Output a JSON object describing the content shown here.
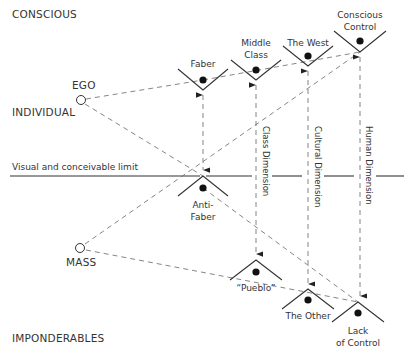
{
  "zones": {
    "top": "CONSCIOUS",
    "bottom": "IMPONDERABLES",
    "individual": "INDIVIDUAL"
  },
  "sources": {
    "ego": "EGO",
    "mass": "MASS"
  },
  "limit_label": "Visual and conceivable limit",
  "upper_nodes": [
    {
      "id": "faber",
      "lines": [
        "Faber"
      ]
    },
    {
      "id": "middle-class",
      "lines": [
        "Middle",
        "Class"
      ]
    },
    {
      "id": "the-west",
      "lines": [
        "The West"
      ]
    },
    {
      "id": "conscious-control",
      "lines": [
        "Conscious",
        "Control"
      ]
    }
  ],
  "lower_nodes": [
    {
      "id": "anti-faber",
      "lines": [
        "Anti-",
        "Faber"
      ]
    },
    {
      "id": "pueblo",
      "lines": [
        "“Pueblo”"
      ]
    },
    {
      "id": "the-other",
      "lines": [
        "The Other"
      ]
    },
    {
      "id": "lack-of-control",
      "lines": [
        "Lack",
        "of Control"
      ]
    }
  ],
  "dimensions": {
    "class": "Class Dimension",
    "cultural": "Cultural Dimension",
    "human": "Human Dimension"
  }
}
